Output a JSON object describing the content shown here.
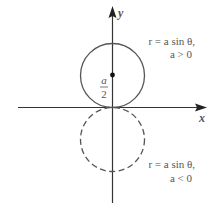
{
  "diagram": {
    "axes": {
      "x_label": "x",
      "y_label": "y"
    },
    "circles": [
      {
        "name": "upper",
        "style": "solid",
        "label_line1": "r = a sin θ,",
        "label_line2": "a > 0"
      },
      {
        "name": "lower",
        "style": "dashed",
        "label_line1": "r = a sin θ,",
        "label_line2": "a < 0"
      }
    ],
    "center_marker": {
      "numerator": "a",
      "denominator": "2"
    },
    "colors": {
      "stroke": "#555555",
      "text": "#555555",
      "axis": "#333333"
    }
  }
}
